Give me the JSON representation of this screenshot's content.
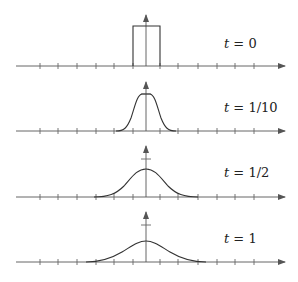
{
  "figure": {
    "panels": [
      {
        "id": "t0",
        "var": "t",
        "eq": " = ",
        "value": "0",
        "shape": "box"
      },
      {
        "id": "t1_10",
        "var": "t",
        "eq": " = ",
        "value": "1/10",
        "shape": "bump"
      },
      {
        "id": "t1_2",
        "var": "t",
        "eq": " = ",
        "value": "1/2",
        "shape": "bump"
      },
      {
        "id": "t1",
        "var": "t",
        "eq": " = ",
        "value": "1",
        "shape": "bump"
      }
    ]
  },
  "colors": {
    "axis": "#555555",
    "curve": "#333333",
    "text": "#222222",
    "background": "#ffffff"
  }
}
